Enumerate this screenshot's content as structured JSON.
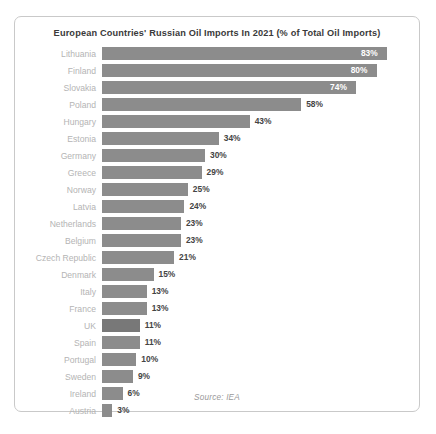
{
  "card": {
    "border_color": "#c9c9c9",
    "background": "#ffffff"
  },
  "source_note": "Source: IEA",
  "chart_data": {
    "type": "bar",
    "orientation": "horizontal",
    "title": "European Countries' Russian Oil Imports In 2021 (% of Total Oil Imports)",
    "xlabel": "",
    "ylabel": "",
    "xlim": [
      0,
      90
    ],
    "grid": false,
    "legend": null,
    "bar_color": "#8c8c8c",
    "highlight_color": "#787878",
    "value_suffix": "%",
    "categories": [
      "Lithuania",
      "Finland",
      "Slovakia",
      "Poland",
      "Hungary",
      "Estonia",
      "Germany",
      "Greece",
      "Norway",
      "Latvia",
      "Netherlands",
      "Belgium",
      "Czech Republic",
      "Denmark",
      "Italy",
      "France",
      "UK",
      "Spain",
      "Portugal",
      "Sweden",
      "Ireland",
      "Austria"
    ],
    "values": [
      83,
      80,
      74,
      58,
      43,
      34,
      30,
      29,
      25,
      24,
      23,
      23,
      21,
      15,
      13,
      13,
      11,
      11,
      10,
      9,
      6,
      3
    ],
    "value_labels": [
      "83%",
      "80%",
      "74%",
      "58%",
      "43%",
      "34%",
      "30%",
      "29%",
      "25%",
      "24%",
      "23%",
      "23%",
      "21%",
      "15%",
      "13%",
      "13%",
      "11%",
      "11%",
      "10%",
      "9%",
      "6%",
      "3%"
    ],
    "label_inside": [
      true,
      true,
      true,
      false,
      false,
      false,
      false,
      false,
      false,
      false,
      false,
      false,
      false,
      false,
      false,
      false,
      false,
      false,
      false,
      false,
      false,
      false
    ],
    "highlighted": [
      "UK"
    ],
    "source": "Source: IEA"
  }
}
